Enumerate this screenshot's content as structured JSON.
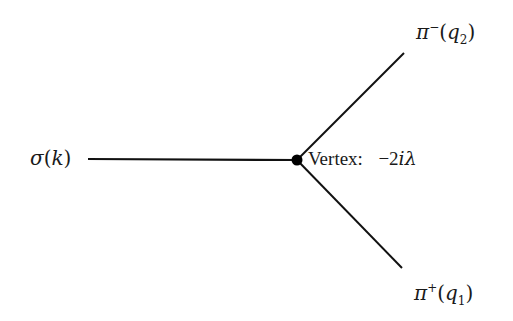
{
  "diagram": {
    "title": "",
    "type": "Feynman vertex diagram",
    "colors": {
      "line": "#111111",
      "vertex": "#000000",
      "background": "#ffffff",
      "text": "#1a1a1a"
    },
    "vertex": {
      "x": 297,
      "y": 160,
      "label_prefix": "Vertex:",
      "label_value": "−2iλ",
      "label_value_sign": "−2",
      "label_value_i": "i",
      "label_value_lambda": "λ"
    },
    "incoming": {
      "particle": "σ",
      "momentum": "k",
      "label": "σ(k)",
      "line_start": {
        "x": 88,
        "y": 159
      },
      "line_end": {
        "x": 297,
        "y": 160
      }
    },
    "outgoing": [
      {
        "particle": "π",
        "charge": "−",
        "momentum_symbol": "q",
        "momentum_index": "2",
        "label": "π⁻(q₂)",
        "line_start": {
          "x": 297,
          "y": 160
        },
        "line_end": {
          "x": 404,
          "y": 53
        }
      },
      {
        "particle": "π",
        "charge": "+",
        "momentum_symbol": "q",
        "momentum_index": "1",
        "label": "π⁺(q₁)",
        "line_start": {
          "x": 297,
          "y": 160
        },
        "line_end": {
          "x": 402,
          "y": 268
        }
      }
    ]
  }
}
